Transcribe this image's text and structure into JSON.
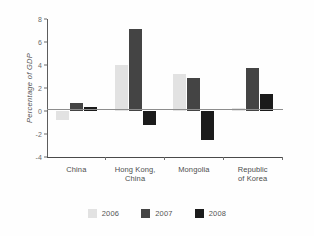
{
  "chart_data": {
    "type": "bar",
    "title": "",
    "subtitle": "",
    "xlabel": "",
    "ylabel": "Percentage of GDP",
    "ylim": [
      -4,
      8
    ],
    "yticks": [
      8,
      6,
      4,
      2,
      0,
      -2,
      -4
    ],
    "ytick_labels": [
      "8",
      "6",
      "4",
      "2",
      "0",
      "-2",
      "-4"
    ],
    "grid": false,
    "legend_position": "bottom",
    "categories": [
      "China",
      "Hong Kong, China",
      "Mongolia",
      "Republic of Korea"
    ],
    "series": [
      {
        "name": "2006",
        "color": "#e2e2e2",
        "values": [
          -0.8,
          4.0,
          3.2,
          0.3
        ]
      },
      {
        "name": "2007",
        "color": "#444444",
        "values": [
          0.7,
          7.15,
          2.85,
          3.75
        ]
      },
      {
        "name": "2008",
        "color": "#1b1b1b",
        "values": [
          0.35,
          -1.2,
          -2.5,
          1.45
        ]
      }
    ],
    "zero_line": 0
  },
  "axis": {
    "y_title": "Percentage of GDP"
  },
  "legend": {
    "items": [
      {
        "label": "2006"
      },
      {
        "label": "2007"
      },
      {
        "label": "2008"
      }
    ]
  },
  "category_labels": [
    "China",
    "Hong Kong,\nChina",
    "Mongolia",
    "Republic\nof Korea"
  ]
}
